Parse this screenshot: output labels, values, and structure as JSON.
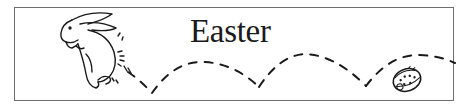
{
  "banner": {
    "title": "Easter",
    "icons": [
      "rabbit-icon",
      "easter-egg-icon",
      "dashed-hop-path"
    ],
    "colors": {
      "ink": "#1a1a1a",
      "border": "#6e6e6e",
      "background": "#ffffff"
    }
  }
}
